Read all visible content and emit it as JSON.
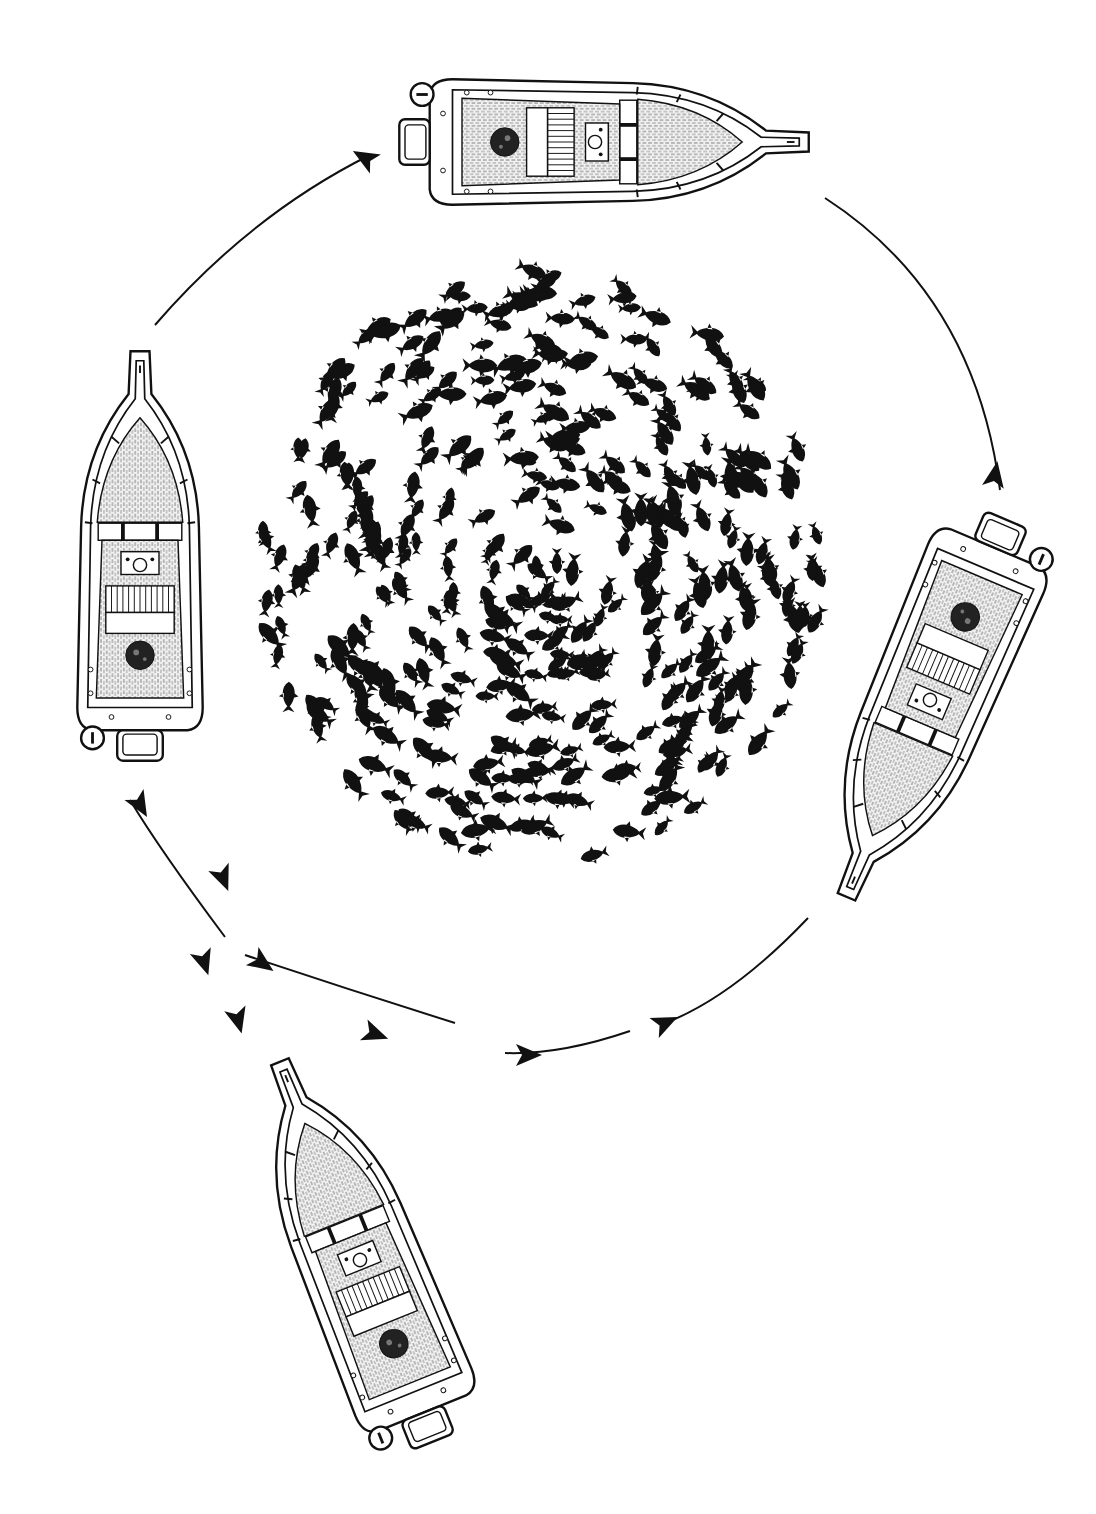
{
  "title": {
    "text": "",
    "visible": false
  },
  "colors": {
    "ink": "#111111",
    "paper": "#ffffff",
    "deck": "#e9e9e9"
  },
  "circle_path": {
    "cx": 560,
    "cy": 620,
    "r": 450
  },
  "boats": [
    {
      "id": "boat-top",
      "cx": 595,
      "cy": 142,
      "rotation": 90,
      "scale": 1.0
    },
    {
      "id": "boat-left",
      "cx": 140,
      "cy": 565,
      "rotation": 0,
      "scale": 1.0
    },
    {
      "id": "boat-right",
      "cx": 930,
      "cy": 700,
      "rotation": 203,
      "scale": 1.0
    },
    {
      "id": "boat-bottom",
      "cx": 360,
      "cy": 1260,
      "rotation": -22,
      "scale": 1.0
    }
  ],
  "arrows": [
    {
      "id": "arrow-seg-1",
      "d": "M 155 325 Q 250 215 370 155",
      "head": [
        365,
        158,
        30
      ]
    },
    {
      "id": "arrow-seg-2",
      "d": "M 825 198 Q 975 295 1000 490",
      "head": [
        995,
        475,
        100
      ]
    },
    {
      "id": "arrow-seg-3",
      "d": "M 808 918 Q 730 1000 660 1025",
      "head": [
        665,
        1023,
        155
      ]
    },
    {
      "id": "arrow-seg-4",
      "d": "M 630 1031 Q 560 1055 505 1053",
      "head": [
        528,
        1055,
        180
      ]
    },
    {
      "id": "arrow-seg-5",
      "d": "M 455 1023 Q 350 990 245 955",
      "head": [
        375,
        1034,
        200
      ]
    },
    {
      "id": "arrow-seg-6",
      "d": "M 225 937 Q 160 850 130 800",
      "head": [
        140,
        805,
        240
      ]
    }
  ],
  "arrow_heads_extra": [
    [
      262,
      963,
      215
    ],
    [
      223,
      878,
      248
    ],
    [
      204,
      962,
      252
    ],
    [
      238,
      1020,
      255
    ]
  ],
  "fish_school": {
    "cx": 540,
    "cy": 565,
    "rx": 290,
    "ry": 305,
    "count": 420,
    "seed": 7
  }
}
